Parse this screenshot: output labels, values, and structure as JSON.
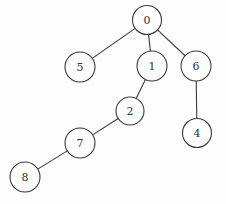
{
  "diagram": {
    "type": "tree",
    "background_color": "#fdfdfd",
    "stroke_color": "#3b3b3b",
    "text_color": "#333333",
    "node_fill": "#fdfdfd",
    "nodes": [
      {
        "id": "0",
        "label": "0",
        "x": 147,
        "y": 20,
        "r": 14.5
      },
      {
        "id": "5",
        "label": "5",
        "x": 80,
        "y": 67,
        "r": 15
      },
      {
        "id": "1",
        "label": "1",
        "x": 152,
        "y": 66,
        "r": 15
      },
      {
        "id": "6",
        "label": "6",
        "x": 196,
        "y": 66,
        "r": 15
      },
      {
        "id": "2",
        "label": "2",
        "x": 130,
        "y": 111,
        "r": 14
      },
      {
        "id": "4",
        "label": "4",
        "x": 197,
        "y": 133,
        "r": 14.5
      },
      {
        "id": "7",
        "label": "7",
        "x": 80,
        "y": 143,
        "r": 15
      },
      {
        "id": "8",
        "label": "8",
        "x": 25,
        "y": 177,
        "r": 15
      }
    ],
    "edges": [
      {
        "from": "0",
        "to": "5"
      },
      {
        "from": "0",
        "to": "1"
      },
      {
        "from": "0",
        "to": "6"
      },
      {
        "from": "1",
        "to": "2"
      },
      {
        "from": "6",
        "to": "4"
      },
      {
        "from": "2",
        "to": "7"
      },
      {
        "from": "7",
        "to": "8"
      }
    ]
  }
}
